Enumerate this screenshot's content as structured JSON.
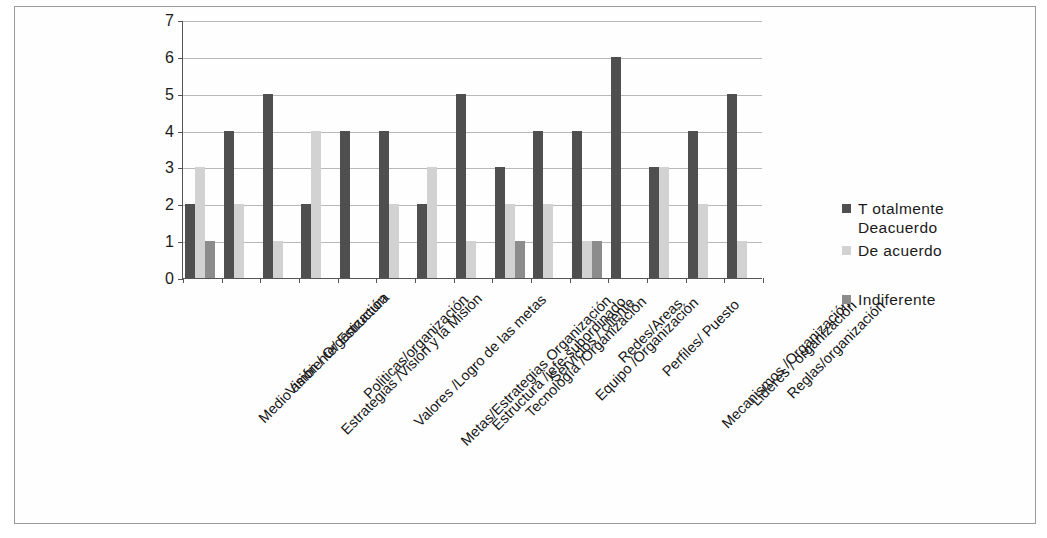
{
  "chart_data": {
    "type": "bar",
    "title": "",
    "xlabel": "",
    "ylabel": "",
    "ylim": [
      0,
      7
    ],
    "yticks": [
      0,
      1,
      2,
      3,
      4,
      5,
      6,
      7
    ],
    "grid": true,
    "legend_position": "right",
    "categories": [
      "Medio ambiente/ Estructura",
      "Visión / Organización",
      "Estrategias /Visión y la Misión",
      "Politicas/organización",
      "Valores /Logro de las metas",
      "Metas/Estrategias Organización",
      "Estructura /jefe-subordinado",
      "Tecnología /Organización",
      "Servicios / cliente",
      "Equipo /Organización",
      "Redes/Areas",
      "Perfiles/ Puesto",
      "Mecanismos /Organización",
      "Lideres / organización",
      "Reglas/organización"
    ],
    "series": [
      {
        "name": "Totalmente Deacuerdo",
        "color": "#4f4f4f",
        "values": [
          2,
          4,
          5,
          2,
          4,
          4,
          2,
          5,
          3,
          4,
          4,
          6,
          3,
          4,
          5
        ]
      },
      {
        "name": "De acuerdo",
        "color": "#d2d2d2",
        "values": [
          3,
          2,
          1,
          4,
          0,
          2,
          3,
          1,
          2,
          2,
          1,
          0,
          3,
          2,
          1
        ]
      },
      {
        "name": "Indiferente",
        "color": "#8c8c8c",
        "values": [
          1,
          0,
          0,
          0,
          0,
          0,
          0,
          0,
          1,
          0,
          1,
          0,
          0,
          0,
          0
        ]
      }
    ]
  },
  "legend": {
    "entries": [
      {
        "label_line1": "T otalmente",
        "label_line2": "Deacuerdo"
      },
      {
        "label_line1": "De acuerdo",
        "label_line2": ""
      },
      {
        "label_line1": "Indiferente",
        "label_line2": ""
      }
    ]
  }
}
